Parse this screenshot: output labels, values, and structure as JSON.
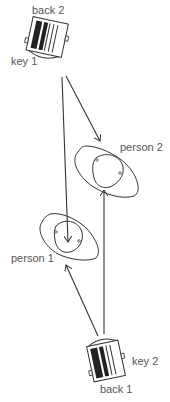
{
  "diagram": {
    "type": "spatial-relationship-diagram",
    "nodes": [
      {
        "id": "device_top",
        "labels": {
          "top": "back 2",
          "side": "key 1"
        }
      },
      {
        "id": "person2",
        "label": "person 2"
      },
      {
        "id": "person1",
        "label": "person 1"
      },
      {
        "id": "device_bottom",
        "labels": {
          "side": "key 2",
          "bottom": "back 1"
        }
      }
    ],
    "edges": [
      {
        "from": "device_top",
        "to": "person1"
      },
      {
        "from": "device_top",
        "to": "person2"
      },
      {
        "from": "device_bottom",
        "to": "person1"
      },
      {
        "from": "device_bottom",
        "to": "person2"
      }
    ]
  },
  "labels": {
    "back2": "back 2",
    "key1": "key 1",
    "person2": "person 2",
    "person1": "person 1",
    "key2": "key 2",
    "back1": "back 1"
  },
  "colors": {
    "stroke": "#333333",
    "text": "#555555",
    "background": "#ffffff"
  }
}
